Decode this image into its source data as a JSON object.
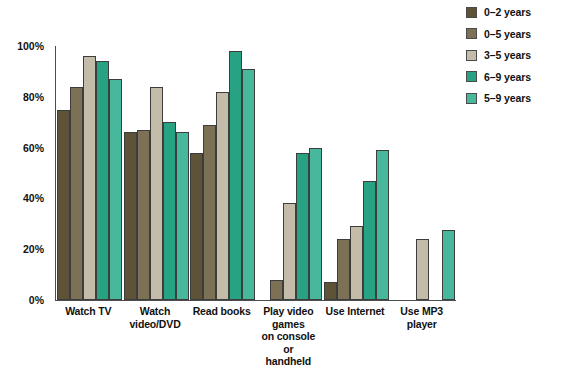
{
  "chart_data": {
    "type": "bar",
    "title": "",
    "subtitle": "",
    "xlabel": "",
    "ylabel": "",
    "ylim": [
      0,
      100
    ],
    "ytick_labels": [
      "100%",
      "80%",
      "60%",
      "40%",
      "20%",
      "0%"
    ],
    "ytick_values": [
      100,
      80,
      60,
      40,
      20,
      0
    ],
    "grid": false,
    "legend_position": "top-right",
    "categories": [
      "Watch TV",
      "Watch video/DVD",
      "Read books",
      "Play video games on console or handheld",
      "Use Internet",
      "Use MP3 player"
    ],
    "category_label_lines": [
      [
        "Watch TV"
      ],
      [
        "Watch video/DVD"
      ],
      [
        "Read books"
      ],
      [
        "Play video games",
        "on console or",
        "handheld"
      ],
      [
        "Use Internet"
      ],
      [
        "Use MP3 player"
      ]
    ],
    "series": [
      {
        "name": "0–2 years",
        "color": "#5e5337",
        "values": [
          75,
          66,
          58,
          null,
          7,
          null
        ]
      },
      {
        "name": "0–5 years",
        "color": "#7c7055",
        "values": [
          84,
          67,
          69,
          8,
          24,
          null
        ]
      },
      {
        "name": "3–5 years",
        "color": "#c3bca8",
        "values": [
          96,
          84,
          82,
          38,
          29,
          24
        ]
      },
      {
        "name": "6–9 years",
        "color": "#27a384",
        "values": [
          94,
          70,
          98,
          58,
          47,
          null
        ]
      },
      {
        "name": "5–9 years",
        "color": "#48b89d",
        "values": [
          87,
          66,
          91,
          60,
          59,
          27.5
        ]
      }
    ]
  }
}
